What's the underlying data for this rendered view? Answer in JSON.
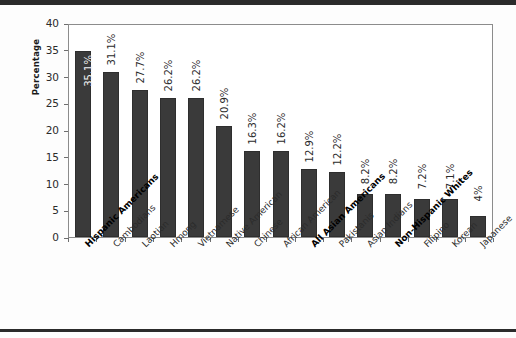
{
  "chart_data": {
    "type": "bar",
    "title": "",
    "xlabel": "",
    "ylabel": "Percentage",
    "ylim": [
      0,
      40
    ],
    "ytick_labels": [
      "0",
      "5",
      "10",
      "15",
      "20",
      "25",
      "30",
      "35",
      "40"
    ],
    "ytick_values": [
      0,
      5,
      10,
      15,
      20,
      25,
      30,
      35,
      40
    ],
    "grid": false,
    "legend": "none",
    "bar_color": "#3a3a3a",
    "categories": [
      "Hispanic Americans",
      "Cambodians",
      "Laotian",
      "Hmong",
      "Vietnamese",
      "Native American",
      "Chinese",
      "African American",
      "All Asian Americans",
      "Pakistanis",
      "Asian Indians",
      "Non-Hispanic Whites",
      "Filipino",
      "Korean",
      "Japanese"
    ],
    "emphasized_categories": [
      "Hispanic Americans",
      "All Asian Americans",
      "Non-Hispanic Whites"
    ],
    "values": [
      35.1,
      31.1,
      27.7,
      26.2,
      26.2,
      20.9,
      16.3,
      16.2,
      12.9,
      12.2,
      8.2,
      8.2,
      7.2,
      7.1,
      4
    ],
    "value_labels": [
      "35.1%",
      "31.1%",
      "27.7%",
      "26.2%",
      "26.2%",
      "20.9%",
      "16.3%",
      "16.2%",
      "12.9%",
      "12.2%",
      "8.2%",
      "8.2%",
      "7.2%",
      "7.1%",
      "4%"
    ],
    "label_placement": [
      "inside",
      "outside",
      "outside",
      "outside",
      "outside",
      "outside",
      "outside",
      "outside",
      "outside",
      "outside",
      "outside",
      "outside",
      "outside",
      "outside",
      "outside"
    ]
  }
}
